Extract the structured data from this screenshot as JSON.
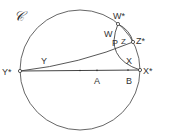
{
  "diagram": {
    "circle_label": "𝒞",
    "labels": {
      "w_star": "W*",
      "z_star": "Z*",
      "x_star": "X*",
      "y_star": "Y*",
      "w": "W",
      "p": "P",
      "z": "Z",
      "x": "X",
      "y": "Y",
      "a": "A",
      "b": "B"
    },
    "colors": {
      "stroke": "#444444",
      "background": "#ffffff"
    }
  }
}
